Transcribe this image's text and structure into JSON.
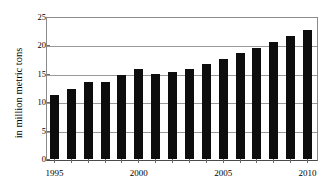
{
  "chart_data": {
    "type": "bar",
    "title": "",
    "subtitle": "",
    "xlabel": "",
    "ylabel": "in million metric tons",
    "ylim": [
      0,
      25
    ],
    "ytick_labels": [
      "0",
      "5",
      "10",
      "15",
      "20",
      "25"
    ],
    "yticks": [
      0,
      5,
      10,
      15,
      20,
      25
    ],
    "grid": true,
    "legend": null,
    "categories": [
      "1995",
      "1996",
      "1997",
      "1998",
      "1999",
      "2000",
      "2001",
      "2002",
      "2003",
      "2004",
      "2005",
      "2006",
      "2007",
      "2008",
      "2009",
      "2010"
    ],
    "visible_xtick_labels": [
      "1995",
      "2000",
      "2005",
      "2010"
    ],
    "values": [
      11.2,
      12.3,
      13.5,
      13.5,
      14.8,
      15.8,
      15.0,
      15.4,
      15.8,
      16.7,
      17.6,
      18.6,
      19.6,
      20.6,
      21.7,
      22.8
    ],
    "bar_color": "#0d0d0d",
    "gridline_color": "#9a9a9a",
    "axis_color": "#4a4a4a",
    "background_color": "#ffffff"
  }
}
